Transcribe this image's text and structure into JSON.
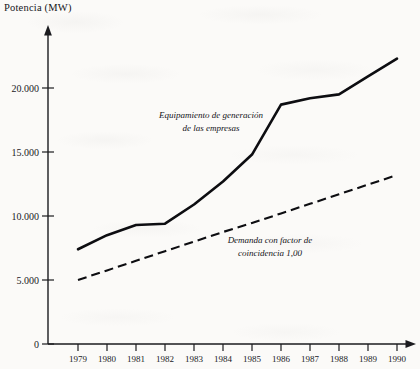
{
  "figure": {
    "axis_title": "Potencia (MW)"
  },
  "chart_data": {
    "type": "line",
    "title": "Potencia (MW)",
    "xlabel": "",
    "ylabel": "Potencia (MW)",
    "x": [
      1979,
      1980,
      1981,
      1982,
      1983,
      1984,
      1985,
      1986,
      1987,
      1988,
      1989,
      1990
    ],
    "categories": [
      "1979",
      "1980",
      "1981",
      "1982",
      "1983",
      "1984",
      "1985",
      "1986",
      "1987",
      "1988",
      "1989",
      "1990"
    ],
    "xlim": [
      1979,
      1990
    ],
    "ylim": [
      0,
      23500
    ],
    "ytick_values": [
      0,
      5000,
      10000,
      15000,
      20000
    ],
    "ytick_labels": [
      "0",
      "5.000",
      "10.000",
      "15.000",
      "20.000"
    ],
    "grid": false,
    "legend": "annotations-inline",
    "series": [
      {
        "name": "Equipamiento de generación de las empresas",
        "style": "solid",
        "color": "#0d0d11",
        "values": [
          7400,
          8500,
          9300,
          9400,
          10900,
          12700,
          14800,
          18700,
          19200,
          19500,
          20900,
          22300
        ]
      },
      {
        "name": "Demanda con factor de coincidencia 1,00",
        "style": "dashed",
        "color": "#0d0d11",
        "values": [
          5000,
          5750,
          6500,
          7250,
          8000,
          8750,
          9450,
          10200,
          10950,
          11700,
          12450,
          13200
        ]
      }
    ],
    "annotations": [
      {
        "id": "annotation-equipamiento",
        "lines": [
          "Equipamiento de generación",
          "de las empresas"
        ],
        "style": "italic"
      },
      {
        "id": "annotation-demanda",
        "lines": [
          "Demanda con factor de",
          "coincidencia 1,00"
        ],
        "style": "italic"
      }
    ]
  }
}
